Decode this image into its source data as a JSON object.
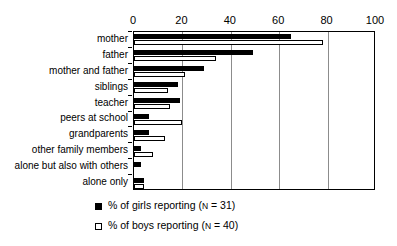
{
  "chart_data": {
    "type": "bar",
    "orientation": "horizontal",
    "title": "",
    "xlabel": "",
    "ylabel": "",
    "xlim": [
      0,
      100
    ],
    "xticks": [
      0,
      20,
      40,
      60,
      80,
      100
    ],
    "xtick_labels": [
      "0",
      "20",
      "40",
      "60",
      "80",
      "100"
    ],
    "grid": true,
    "grid_axis": "x",
    "legend_position": "bottom",
    "categories": [
      "mother",
      "father",
      "mother and father",
      "siblings",
      "teacher",
      "peers at school",
      "grandparents",
      "other family members",
      "alone but also with others",
      "alone only"
    ],
    "series": [
      {
        "name": "% of girls reporting (N = 31)",
        "color": "#000000",
        "values": [
          65,
          49,
          29,
          18,
          19,
          6,
          6,
          3,
          3,
          4
        ]
      },
      {
        "name": "% of boys reporting (N = 40)",
        "color": "#ffffff",
        "values": [
          78,
          34,
          21,
          14,
          15,
          20,
          13,
          8,
          0,
          4
        ]
      }
    ]
  },
  "legend": {
    "items": [
      {
        "marker": "filled-square",
        "text_before": "% of girls reporting (",
        "n_symbol": "N",
        "text_after": " = 31)",
        "full": "% of girls reporting (N = 31)"
      },
      {
        "marker": "open-square",
        "text_before": "% of boys reporting (",
        "n_symbol": "N",
        "text_after": " = 40)",
        "full": "% of boys reporting (N = 40)"
      }
    ]
  },
  "colors": {
    "girls_bar": "#000000",
    "boys_bar": "#ffffff",
    "bar_outline": "#000000",
    "gridline": "#8c8c8c",
    "axis": "#000000",
    "background": "#ffffff"
  }
}
